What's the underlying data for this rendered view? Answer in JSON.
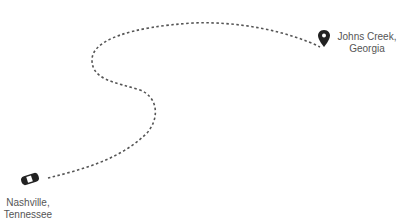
{
  "route": {
    "origin": {
      "label_line1": "Nashville,",
      "label_line2": "Tennessee",
      "icon": "car-icon"
    },
    "destination": {
      "label_line1": "Johns Creek,",
      "label_line2": "Georgia",
      "icon": "map-pin-icon"
    },
    "path_color": "#555555"
  }
}
